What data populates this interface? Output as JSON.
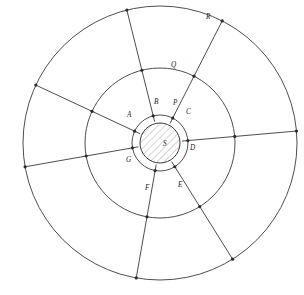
{
  "figure": {
    "background_color": "#ffffff",
    "stroke_color": "#3a3a3a",
    "label_color": "#1e1e1e"
  },
  "center": {
    "cx": 160,
    "cy": 143
  },
  "circles": [
    {
      "id": "core",
      "label": "S",
      "radius": 20,
      "hatched": true,
      "label_x": 163,
      "label_y": 146
    },
    {
      "id": "ring",
      "label": "P",
      "radius": 28,
      "hatched": false,
      "label_x": 173,
      "label_y": 105
    },
    {
      "id": "mid",
      "label": "Q",
      "radius": 75,
      "hatched": false,
      "label_x": 171,
      "label_y": 67
    },
    {
      "id": "outer",
      "label": "R",
      "radius": 137,
      "hatched": false,
      "label_x": 206,
      "label_y": 19
    }
  ],
  "points": [
    {
      "label": "A",
      "angle_deg": 205,
      "label_x": 127,
      "label_y": 117
    },
    {
      "label": "B",
      "angle_deg": 256,
      "label_x": 154,
      "label_y": 104
    },
    {
      "label": "C",
      "angle_deg": 297,
      "label_x": 186,
      "label_y": 114
    },
    {
      "label": "D",
      "angle_deg": 355,
      "label_x": 190,
      "label_y": 150
    },
    {
      "label": "E",
      "angle_deg": 58,
      "label_x": 178,
      "label_y": 187
    },
    {
      "label": "F",
      "angle_deg": 100,
      "label_x": 145,
      "label_y": 190
    },
    {
      "label": "G",
      "angle_deg": 170,
      "label_x": 126,
      "label_y": 162
    }
  ],
  "radials": [
    {
      "from_point": "A",
      "angle_deg": 205,
      "extends_to": "outer"
    },
    {
      "from_point": "B",
      "angle_deg": 256,
      "extends_to": "outer"
    },
    {
      "from_point": "C",
      "angle_deg": 297,
      "extends_to": "outer"
    },
    {
      "from_point": "D",
      "angle_deg": 355,
      "extends_to": "outer"
    },
    {
      "from_point": "E",
      "angle_deg": 58,
      "extends_to": "outer"
    },
    {
      "from_point": "F",
      "angle_deg": 100,
      "extends_to": "outer"
    },
    {
      "from_point": "G",
      "angle_deg": 170,
      "extends_to": "outer"
    }
  ]
}
